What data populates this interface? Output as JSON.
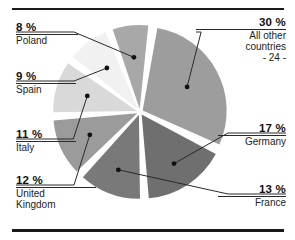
{
  "figure": {
    "type": "pie-chart-figure",
    "top_rule": "horizontal-rule",
    "bottom_rule": "horizontal-rule"
  },
  "chart_data": {
    "type": "pie",
    "title": "",
    "subtitle": "",
    "xlabel": "",
    "ylabel": "",
    "legend_position": "callout-labels",
    "grid": false,
    "unit": "%",
    "categories": [
      "All other countries",
      "Germany",
      "France",
      "United Kingdom",
      "Italy",
      "Spain",
      "Poland"
    ],
    "values": [
      30,
      17,
      13,
      12,
      11,
      9,
      8
    ],
    "colors": [
      "#9d9d9d",
      "#6f6f6f",
      "#797979",
      "#9b9b9b",
      "#d9d9d9",
      "#f1f1f1",
      "#a8a8a8"
    ],
    "total": 100,
    "exploded": true,
    "start_angle_deg": 8,
    "annotations": [
      "- 24 -"
    ]
  },
  "slices": [
    {
      "id": "all-other-countries",
      "percent_label": "30 %",
      "name_line1": "All other",
      "name_line2": "countries",
      "name_line3": "- 24 -",
      "value": 30,
      "color": "#9d9d9d"
    },
    {
      "id": "germany",
      "percent_label": "17 %",
      "name_line1": "Germany",
      "value": 17,
      "color": "#6f6f6f"
    },
    {
      "id": "france",
      "percent_label": "13 %",
      "name_line1": "France",
      "value": 13,
      "color": "#797979"
    },
    {
      "id": "united-kingdom",
      "percent_label": "12 %",
      "name_line1": "United",
      "name_line2": "Kingdom",
      "value": 12,
      "color": "#9b9b9b"
    },
    {
      "id": "italy",
      "percent_label": "11 %",
      "name_line1": "Italy",
      "value": 11,
      "color": "#d9d9d9"
    },
    {
      "id": "spain",
      "percent_label": "9 %",
      "name_line1": "Spain",
      "value": 9,
      "color": "#f1f1f1"
    },
    {
      "id": "poland",
      "percent_label": "8 %",
      "name_line1": "Poland",
      "value": 8,
      "color": "#a8a8a8"
    }
  ]
}
